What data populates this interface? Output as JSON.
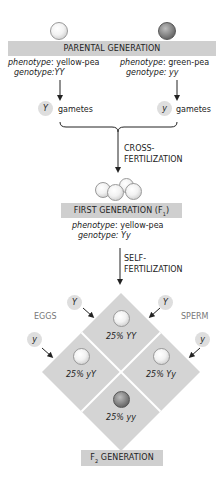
{
  "parental": {
    "title": "PARENTAL GENERATION",
    "left": {
      "phenotype_label": "phenotype",
      "phenotype_value": ": yellow-pea",
      "genotype_label": "genotype",
      "genotype_value": ":YY",
      "gamete_allele": "Y",
      "gamete_label": "gametes",
      "pea_color": "yellow"
    },
    "right": {
      "phenotype_label": "phenotype",
      "phenotype_value": ": green-pea",
      "genotype_label": "genotype",
      "genotype_value": ": yy",
      "gamete_allele": "y",
      "gamete_label": "gametes",
      "pea_color": "green"
    }
  },
  "cross": {
    "label_line1": "CROSS-",
    "label_line2": "FERTILIZATION"
  },
  "f1": {
    "title": "FIRST GENERATION (F",
    "title_sub": "1",
    "title_end": ")",
    "phenotype_label": "phenotype",
    "phenotype_value": ": yellow-pea",
    "genotype_label": "genotype",
    "genotype_value": ": Yy"
  },
  "self": {
    "label_line1": "SELF-",
    "label_line2": "FERTILIZATION"
  },
  "punnett": {
    "eggs_label": "EGGS",
    "sperm_label": "SPERM",
    "egg_alleles": [
      "Y",
      "y"
    ],
    "sperm_alleles": [
      "Y",
      "y"
    ],
    "cells": [
      {
        "label": "25% YY",
        "pea": "yellow"
      },
      {
        "label": "25% yY",
        "pea": "yellow"
      },
      {
        "label": "25% Yy",
        "pea": "yellow"
      },
      {
        "label": "25% yy",
        "pea": "green"
      }
    ]
  },
  "f2": {
    "title_prefix": "F",
    "title_sub": "2",
    "title_rest": " GENERATION"
  },
  "colors": {
    "bar_gray": "#cfcfcf",
    "diamond_gray": "#d4d4d4",
    "gamete_gray": "#dedede"
  }
}
